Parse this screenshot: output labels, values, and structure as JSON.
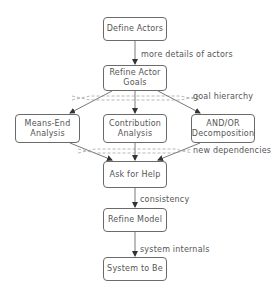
{
  "diagram": {
    "nodes": {
      "define_actors": "Define Actors",
      "refine_actor_goals": "Refine Actor Goals",
      "means_end_analysis": "Means-End Analysis",
      "contribution_analysis": "Contribution Analysis",
      "and_or_decomposition": "AND/OR Decomposition",
      "ask_for_help": "Ask for Help",
      "refine_model": "Refine Model",
      "system_to_be": "System to Be"
    },
    "edge_labels": {
      "more_details_of_actors": "more details of actors",
      "goal_hierarchy": "goal hierarchy",
      "new_dependencies": "new dependencies",
      "consistency": "consistency",
      "system_internals": "system internals"
    },
    "colors": {
      "stroke": "#6a6a6a",
      "dashed": "#888888",
      "text": "#555555"
    }
  }
}
